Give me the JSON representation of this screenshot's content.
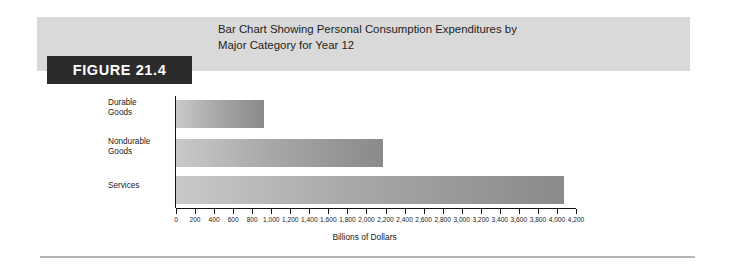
{
  "figure": {
    "tag": "FIGURE 21.4",
    "caption_line1": "Bar Chart Showing Personal Consumption Expenditures by",
    "caption_line2": "Major Category for Year 12"
  },
  "colors": {
    "band": "#d9d9d9",
    "tag_background": "#2b2b2b",
    "tag_text": "#ffffff",
    "bar_light": "#c9c9c9",
    "bar_dark": "#8a8a8a",
    "axis": "#111111",
    "rule": "#b6b6b6"
  },
  "chart_data": {
    "type": "bar",
    "orientation": "horizontal",
    "title": "Bar Chart Showing Personal Consumption Expenditures by Major Category for Year 12",
    "categories": [
      "Durable Goods",
      "Nondurable Goods",
      "Services"
    ],
    "category_lines": [
      [
        "Durable",
        "Goods"
      ],
      [
        "Nondurable",
        "Goods"
      ],
      [
        "Services"
      ]
    ],
    "values": [
      920,
      2170,
      4070
    ],
    "xlabel": "Billions of Dollars",
    "ylabel": "",
    "xlim": [
      0,
      4200
    ],
    "xtick_step": 200,
    "xticks": [
      0,
      200,
      400,
      600,
      800,
      1000,
      1200,
      1400,
      1600,
      1800,
      2000,
      2200,
      2400,
      2600,
      2800,
      3000,
      3200,
      3400,
      3600,
      3800,
      4000,
      4200
    ],
    "xtick_labels": [
      "0",
      "200",
      "400",
      "600",
      "800",
      "1,000",
      "1,200",
      "1,400",
      "1,600",
      "1,800",
      "2,000",
      "2,200",
      "2,400",
      "2,600",
      "2,800",
      "3,000",
      "3,200",
      "3,400",
      "3,600",
      "3,800",
      "4,000",
      "4,200"
    ],
    "grid": false,
    "legend": false
  }
}
